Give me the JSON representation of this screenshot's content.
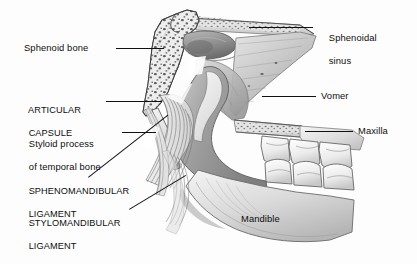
{
  "figure": {
    "background_color": "#fdfdfd",
    "ink_color": "#111111",
    "text_color": "#0d0d0d",
    "width": 417,
    "height": 264
  },
  "labels": {
    "sphenoid_bone": "Sphenoid bone",
    "articular_capsule_line1": "ARTICULAR",
    "articular_capsule_line2": "CAPSULE",
    "styloid_process_line1": "Styloid process",
    "styloid_process_line2": "of temporal bone",
    "sphenomandibular_line1": "SPHENOMANDIBULAR",
    "sphenomandibular_line2": "LIGAMENT",
    "stylomandibular_line1": "STYLOMANDIBULAR",
    "stylomandibular_line2": "LIGAMENT",
    "sphenoidal_sinus_line1": "Sphenoidal",
    "sphenoidal_sinus_line2": "sinus",
    "vomer": "Vomer",
    "maxilla": "Maxilla",
    "mandible": "Mandible"
  },
  "structures": [
    {
      "name": "sphenoid-bone",
      "note": "trabecular / cancellous bone, stippled texture, left upper wedge"
    },
    {
      "name": "sphenoidal-sinus",
      "note": "air cavity within body of sphenoid, upper center"
    },
    {
      "name": "articular-capsule",
      "note": "striated fibrous capsule fibers, center left"
    },
    {
      "name": "styloid-process",
      "note": "slender bony spur of temporal bone, lower left of sphenoid"
    },
    {
      "name": "sphenomandibular-ligament",
      "note": "fibrous band running from sphenoid spine to mandibular lingula"
    },
    {
      "name": "stylomandibular-ligament",
      "note": "fibrous band from styloid process to mandibular angle"
    },
    {
      "name": "vomer",
      "note": "thin plate of nasal septum, right center"
    },
    {
      "name": "maxilla",
      "note": "upper jaw bearing upper molar teeth, right"
    },
    {
      "name": "mandible",
      "note": "lower jaw, ramus and body, lower center-right"
    },
    {
      "name": "molar-teeth",
      "note": "three upper and three lower molars in occlusion"
    }
  ]
}
